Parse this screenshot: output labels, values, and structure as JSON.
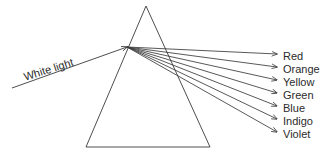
{
  "figure": {
    "kind": "optics-ray-diagram",
    "background_color": "#ffffff",
    "stroke_color": "#3a3a3a",
    "text_color": "#2b2b2b",
    "width": 326,
    "height": 159
  },
  "prism": {
    "name": "triangular-prism",
    "apex": {
      "x": 146,
      "y": 6
    },
    "base_left": {
      "x": 86,
      "y": 147
    },
    "base_right": {
      "x": 210,
      "y": 147
    }
  },
  "incident_ray": {
    "label": "White light",
    "label_x": 24,
    "label_y": 71,
    "label_rotation_deg": -17.5,
    "start": {
      "x": 12,
      "y": 88
    },
    "end": {
      "x": 127,
      "y": 47
    }
  },
  "dispersion": {
    "origin": {
      "x": 127,
      "y": 47
    },
    "arrow_tip_x": 277,
    "label_x": 283,
    "rays": [
      {
        "label": "Red",
        "tip_y": 54,
        "label_y": 57
      },
      {
        "label": "Orange",
        "tip_y": 67,
        "label_y": 70
      },
      {
        "label": "Yellow",
        "tip_y": 80,
        "label_y": 83
      },
      {
        "label": "Green",
        "tip_y": 93,
        "label_y": 96
      },
      {
        "label": "Blue",
        "tip_y": 106,
        "label_y": 109
      },
      {
        "label": "Indigo",
        "tip_y": 119,
        "label_y": 122
      },
      {
        "label": "Violet",
        "tip_y": 132,
        "label_y": 135
      }
    ]
  }
}
